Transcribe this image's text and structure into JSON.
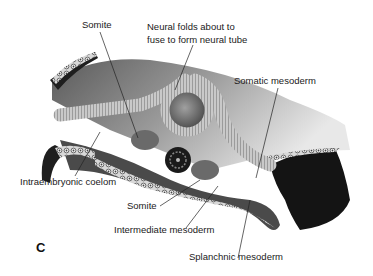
{
  "figure": {
    "panel_letter": "C",
    "labels": {
      "somite_top": "Somite",
      "neural_folds_line1": "Neural folds about to",
      "neural_folds_line2": "fuse to form neural tube",
      "somatic_mesoderm": "Somatic mesoderm",
      "intraembryonic_coelom": "Intraembryonic coelom",
      "somite_bottom": "Somite",
      "intermediate_mesoderm": "Intermediate mesoderm",
      "splanchnic_mesoderm": "Splanchnic mesoderm"
    }
  }
}
